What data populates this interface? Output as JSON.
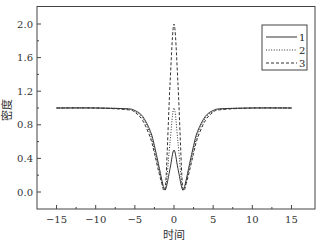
{
  "chart_data": {
    "type": "line",
    "title": "",
    "xlabel": "时间",
    "ylabel": "密度",
    "xlim": [
      -17.5,
      18
    ],
    "ylim": [
      -0.2,
      2.2
    ],
    "xticks": [
      -15,
      -10,
      -5,
      0,
      5,
      10,
      15
    ],
    "xtick_labels": [
      "−15",
      "−10",
      "−5",
      "0",
      "5",
      "10",
      "15"
    ],
    "yticks": [
      0.0,
      0.4,
      0.8,
      1.2,
      1.6,
      2.0
    ],
    "ytick_labels": [
      "0.0",
      "0.4",
      "0.8",
      "1.2",
      "1.6",
      "2.0"
    ],
    "grid": false,
    "legend_position": "upper right",
    "x": [
      -15,
      -10,
      -6,
      -5,
      -4,
      -3,
      -2.5,
      -2,
      -1.5,
      -1.25,
      -1,
      -0.5,
      0,
      0.5,
      1,
      1.25,
      1.5,
      2,
      2.5,
      3,
      4,
      5,
      6,
      10,
      15
    ],
    "series": [
      {
        "name": "1",
        "style": "solid",
        "values": [
          1.0,
          1.0,
          0.99,
          0.97,
          0.9,
          0.72,
          0.55,
          0.34,
          0.12,
          0.04,
          0.05,
          0.28,
          0.5,
          0.28,
          0.05,
          0.04,
          0.12,
          0.34,
          0.55,
          0.72,
          0.9,
          0.97,
          0.99,
          1.0,
          1.0
        ]
      },
      {
        "name": "2",
        "style": "dotted",
        "values": [
          1.0,
          1.0,
          0.99,
          0.96,
          0.88,
          0.68,
          0.5,
          0.3,
          0.1,
          0.03,
          0.08,
          0.6,
          1.0,
          0.6,
          0.08,
          0.03,
          0.1,
          0.3,
          0.5,
          0.68,
          0.88,
          0.96,
          0.99,
          1.0,
          1.0
        ]
      },
      {
        "name": "3",
        "style": "dashed",
        "values": [
          1.0,
          1.0,
          0.98,
          0.95,
          0.85,
          0.64,
          0.46,
          0.26,
          0.08,
          0.02,
          0.2,
          1.3,
          2.0,
          1.3,
          0.2,
          0.02,
          0.08,
          0.26,
          0.46,
          0.64,
          0.85,
          0.95,
          0.98,
          1.0,
          1.0
        ]
      }
    ]
  },
  "colors": {
    "line": "#333333",
    "axis": "#444444",
    "background": "#ffffff"
  }
}
